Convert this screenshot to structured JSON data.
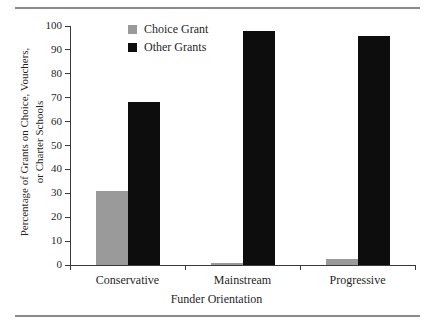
{
  "chart_data": {
    "type": "bar",
    "title": "",
    "xlabel": "Funder Orientation",
    "ylabel": "Percentage of Grants on Choice, Vouchers, or Charter Schools",
    "ylabel_line1": "Percentage of Grants on Choice, Vouchers,",
    "ylabel_line2": "or Charter Schools",
    "categories": [
      "Conservative",
      "Mainstream",
      "Progressive"
    ],
    "series": [
      {
        "name": "Choice Grant",
        "color": "#9a9a9a",
        "values": [
          31,
          1,
          2.5
        ]
      },
      {
        "name": "Other Grants",
        "color": "#0d0d0d",
        "values": [
          68,
          98,
          96
        ]
      }
    ],
    "ylim": [
      0,
      100
    ],
    "yticks": [
      0,
      10,
      20,
      30,
      40,
      50,
      60,
      70,
      80,
      90,
      100
    ],
    "ytick_labels": [
      "0",
      "10",
      "20",
      "30",
      "40",
      "50",
      "60",
      "70",
      "80",
      "90",
      "100"
    ],
    "grid": false,
    "legend_position": "top-center"
  },
  "legend": {
    "items": [
      {
        "label": "Choice Grant",
        "color": "#9a9a9a"
      },
      {
        "label": "Other Grants",
        "color": "#0d0d0d"
      }
    ]
  }
}
